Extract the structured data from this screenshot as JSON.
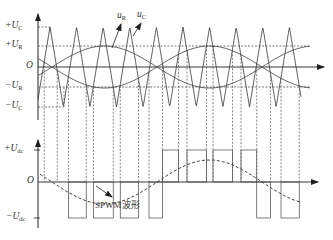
{
  "diagram": {
    "upper_plot": {
      "y_labels": [
        {
          "sign": "+",
          "var": "U",
          "sub": "C",
          "y": 27
        },
        {
          "sign": "+",
          "var": "U",
          "sub": "R",
          "y": 46
        },
        {
          "sign": "",
          "var": "O",
          "sub": "",
          "y": 67
        },
        {
          "sign": "−",
          "var": "U",
          "sub": "R",
          "y": 87
        },
        {
          "sign": "−",
          "var": "U",
          "sub": "C",
          "y": 107
        }
      ],
      "signal_labels": [
        {
          "var": "u",
          "sub": "R",
          "desc": "sinusoidal reference (modulating) wave"
        },
        {
          "var": "u",
          "sub": "C",
          "desc": "triangular carrier wave"
        }
      ]
    },
    "lower_plot": {
      "y_labels": [
        {
          "sign": "+",
          "var": "U",
          "sub": "dc",
          "y": 150
        },
        {
          "sign": "",
          "var": "O",
          "sub": "",
          "y": 182
        },
        {
          "sign": "−",
          "var": "U",
          "sub": "dc",
          "y": 218
        }
      ],
      "annotation": "SPWM波形"
    },
    "colors": {
      "line": "#333333",
      "dashed": "#555555",
      "background": "#ffffff"
    }
  }
}
